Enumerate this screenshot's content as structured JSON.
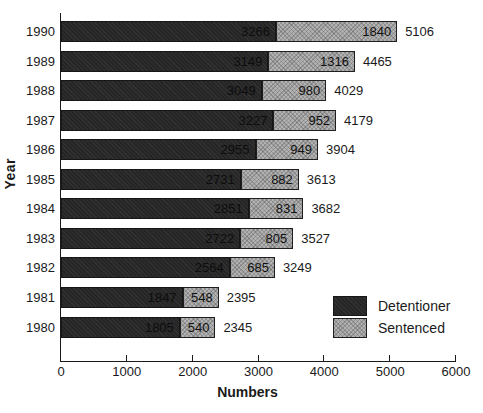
{
  "edge_artifact": ":",
  "chart_data": {
    "type": "bar",
    "orientation": "horizontal",
    "stacked": true,
    "title": "",
    "xlabel": "Numbers",
    "ylabel": "Year",
    "xlim": [
      0,
      6000
    ],
    "xticks": [
      0,
      1000,
      2000,
      3000,
      4000,
      5000,
      6000
    ],
    "grid": false,
    "legend_position": "lower-right",
    "categories": [
      "1990",
      "1989",
      "1988",
      "1987",
      "1986",
      "1985",
      "1984",
      "1983",
      "1982",
      "1981",
      "1980"
    ],
    "series": [
      {
        "name": "Detentioner",
        "color": "#262626",
        "values": [
          3266,
          3149,
          3049,
          3227,
          2955,
          2731,
          2851,
          2722,
          2564,
          1847,
          1805
        ]
      },
      {
        "name": "Sentenced",
        "color": "#b2b2b2",
        "values": [
          1840,
          1316,
          980,
          952,
          949,
          882,
          831,
          805,
          685,
          548,
          540
        ]
      }
    ],
    "totals": [
      5106,
      4465,
      4029,
      4179,
      3904,
      3613,
      3682,
      3527,
      3249,
      2395,
      2345
    ],
    "bar_value_labels": true
  }
}
